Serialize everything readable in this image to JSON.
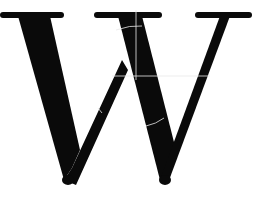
{
  "image": {
    "glyph": "W",
    "description": "Large black serif letter W with faint white guide lines",
    "colors": {
      "background": "#ffffff",
      "glyph": "#0a0a0a",
      "guide_lines": "#e8e8e8"
    }
  }
}
